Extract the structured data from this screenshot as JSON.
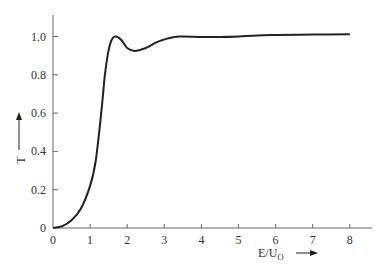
{
  "chart_data": {
    "type": "line",
    "title": "",
    "xlabel": "E/U₀",
    "ylabel": "T",
    "xlim": [
      0,
      8.5
    ],
    "ylim": [
      0,
      1.1
    ],
    "grid": false,
    "legend": null,
    "x_ticks": [
      "0",
      "1",
      "2",
      "3",
      "4",
      "5",
      "6",
      "7",
      "8"
    ],
    "y_ticks": [
      "0",
      "0.2",
      "0.4",
      "0.6",
      "0.8",
      "1.0"
    ],
    "series": [
      {
        "name": "T",
        "x": [
          0,
          0.25,
          0.5,
          0.75,
          1.0,
          1.15,
          1.3,
          1.4,
          1.5,
          1.6,
          1.7,
          1.85,
          2.0,
          2.2,
          2.5,
          2.8,
          3.1,
          3.4,
          4.0,
          4.5,
          5.0,
          5.5,
          6.0,
          7.0,
          8.0
        ],
        "y": [
          0,
          0.01,
          0.04,
          0.1,
          0.22,
          0.35,
          0.6,
          0.8,
          0.93,
          0.99,
          1.0,
          0.98,
          0.94,
          0.925,
          0.94,
          0.97,
          0.99,
          1.0,
          0.998,
          0.997,
          1.0,
          1.006,
          1.008,
          1.01,
          1.012
        ]
      }
    ]
  },
  "axes": {
    "x_label_main": "E/U",
    "x_label_sub": "O",
    "y_label": "T"
  }
}
